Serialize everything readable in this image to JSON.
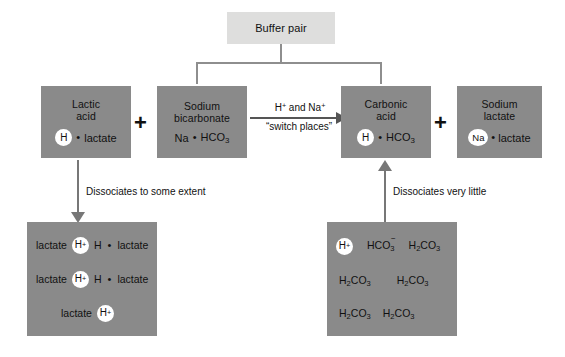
{
  "diagram": {
    "title": "Buffer pair",
    "top": {
      "label": "Buffer pair"
    },
    "reactants": [
      {
        "name": "lactic-acid",
        "line1": "Lactic",
        "line2": "acid",
        "circle": "H",
        "dot": "•",
        "tail": "lactate"
      },
      {
        "name": "sodium-bicarbonate",
        "line1": "Sodium",
        "line2": "bicarbonate",
        "formula_prefix": "Na",
        "dot": "•",
        "formula_main": "HCO",
        "formula_sub": "3"
      }
    ],
    "products": [
      {
        "name": "carbonic-acid",
        "line1": "Carbonic",
        "line2": "acid",
        "circle": "H",
        "dot": "•",
        "formula_main": "HCO",
        "formula_sub": "3"
      },
      {
        "name": "sodium-lactate",
        "line1": "Sodium",
        "line2": "lactate",
        "circle": "Na",
        "dot": "•",
        "tail": "lactate"
      }
    ],
    "plus_left": "+",
    "plus_right": "+",
    "reaction_arrow": {
      "label_top_a": "H",
      "label_top_a_sup": "+",
      "label_top_mid": " and Na",
      "label_top_b_sup": "+",
      "label_bottom": "“switch places”"
    },
    "left_caption": "Dissociates to some extent",
    "right_caption": "Dissociates very little",
    "left_products_box": {
      "name": "lactic-acid-dissociation",
      "rows": [
        {
          "left": "lactate",
          "circle": "H",
          "circle_sup": "+",
          "right_h": "H",
          "dot": "•",
          "right_tail": "lactate"
        },
        {
          "left": "lactate",
          "circle": "H",
          "circle_sup": "+",
          "right_h": "H",
          "dot": "•",
          "right_tail": "lactate"
        },
        {
          "left": "lactate",
          "circle": "H",
          "circle_sup": "+",
          "right_h": "",
          "dot": "",
          "right_tail": ""
        }
      ]
    },
    "right_products_box": {
      "name": "carbonic-acid-dissociation",
      "row1": {
        "circle": "H",
        "circle_sup": "+",
        "bicarb_main": "HCO",
        "bicarb_sub": "3",
        "bicarb_charge": "−",
        "carbonic_a": "H",
        "carbonic_a_sub": "2",
        "carbonic_b": "CO",
        "carbonic_b_sub": "3"
      },
      "row2": [
        {
          "a": "H",
          "a_sub": "2",
          "b": "CO",
          "b_sub": "3"
        },
        {
          "a": "H",
          "a_sub": "2",
          "b": "CO",
          "b_sub": "3"
        }
      ],
      "row3": [
        {
          "a": "H",
          "a_sub": "2",
          "b": "CO",
          "b_sub": "3"
        },
        {
          "a": "H",
          "a_sub": "2",
          "b": "CO",
          "b_sub": "3"
        }
      ]
    },
    "colors": {
      "box_gray": "#8a8a8a",
      "buffer_gray": "#dededd",
      "shadow_gray": "#c8c8c8",
      "line_gray": "#8e8e8e",
      "arrow_gray": "#777777",
      "text": "#111111",
      "circle_fill": "#ffffff",
      "background": "#ffffff"
    }
  }
}
